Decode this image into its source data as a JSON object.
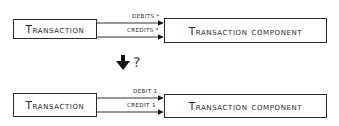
{
  "top": {
    "source": "Transaction",
    "target": "Transaction Component",
    "edges": [
      {
        "label": "Debits",
        "multiplicity": "*"
      },
      {
        "label": "Credits",
        "multiplicity": "*"
      }
    ]
  },
  "transition": {
    "arrow": "down-arrow-icon",
    "question": "?"
  },
  "bottom": {
    "source": "Transaction",
    "target": "Transaction Component",
    "edges": [
      {
        "label": "Debit",
        "multiplicity": "1"
      },
      {
        "label": "Credit",
        "multiplicity": "1"
      }
    ]
  },
  "text": {
    "top_debits": "DEBITS *",
    "top_credits": "CREDITS *",
    "bottom_debit": "DEBIT 1",
    "bottom_credit": "CREDIT 1"
  }
}
